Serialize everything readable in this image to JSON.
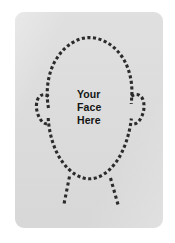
{
  "page": {
    "background_color": "#ffffff"
  },
  "card": {
    "name": "photo-placeholder-card",
    "fill_color": "#dcdcdc",
    "corner_radius": "9px",
    "width": 148,
    "height": 216
  },
  "silhouette": {
    "name": "head-and-shoulders-outline",
    "stroke_color": "#2b2b2b",
    "style": "dotted",
    "description": "dashed head, ears and neck outline"
  },
  "caption": {
    "text": "Your Face Here",
    "lines": [
      "Your",
      "Face",
      "Here"
    ],
    "color": "#141414",
    "weight": "bold",
    "align": "left"
  }
}
